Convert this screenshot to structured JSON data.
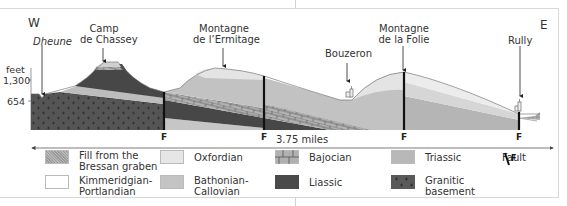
{
  "directions": {
    "west": "W",
    "east": "E"
  },
  "places": [
    {
      "id": "dheune",
      "label": "Dheune",
      "italic": true
    },
    {
      "id": "camp-de-chassey",
      "label_lines": [
        "Camp",
        "de Chassey"
      ]
    },
    {
      "id": "montagne-ermitage",
      "label_lines": [
        "Montagne",
        "de l’Ermitage"
      ]
    },
    {
      "id": "bouzeron",
      "label_lines": [
        "Bouzeron"
      ]
    },
    {
      "id": "montagne-folie",
      "label_lines": [
        "Montagne",
        "de la Folie"
      ]
    },
    {
      "id": "rully",
      "label_lines": [
        "Rully"
      ]
    }
  ],
  "elevation_axis": {
    "unit": "feet",
    "ticks": [
      "1,300",
      "654"
    ]
  },
  "fault_label": "F",
  "faults": [
    "F",
    "F",
    "F",
    "F"
  ],
  "scale_bar": {
    "label": "3.75 miles"
  },
  "legend": [
    {
      "id": "fill-bressan",
      "lines": [
        "Fill from the",
        "Bressan graben"
      ],
      "color": "#a8a8a8",
      "pattern": "speckle"
    },
    {
      "id": "oxfordian",
      "lines": [
        "Oxfordian"
      ],
      "color": "#e6e6e6",
      "pattern": "solid"
    },
    {
      "id": "bajocian",
      "lines": [
        "Bajocian"
      ],
      "color": "#b0b0b0",
      "pattern": "brick"
    },
    {
      "id": "triassic",
      "lines": [
        "Triassic"
      ],
      "color": "#b8b8b8",
      "pattern": "solid"
    },
    {
      "id": "fault",
      "lines": [
        "Fault"
      ],
      "symbol": "F"
    },
    {
      "id": "kimmeridgian",
      "lines": [
        "Kimmeridgian-",
        "Portlandian"
      ],
      "color": "#ffffff",
      "pattern": "solid"
    },
    {
      "id": "bathonian",
      "lines": [
        "Bathonian-",
        "Callovian"
      ],
      "color": "#c4c4c4",
      "pattern": "solid"
    },
    {
      "id": "liassic",
      "lines": [
        "Liassic"
      ],
      "color": "#4a4a4a",
      "pattern": "solid"
    },
    {
      "id": "granitic",
      "lines": [
        "Granitic",
        "basement"
      ],
      "color": "#5a5a5a",
      "pattern": "cross"
    }
  ]
}
